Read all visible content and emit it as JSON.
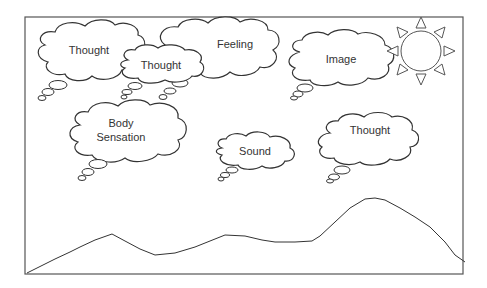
{
  "diagram": {
    "title": "",
    "clouds": [
      {
        "id": "thought-1",
        "label": "Thought"
      },
      {
        "id": "thought-2",
        "label": "Thought"
      },
      {
        "id": "feeling",
        "label": "Feeling"
      },
      {
        "id": "image",
        "label": "Image"
      },
      {
        "id": "body-sensation",
        "label_line1": "Body",
        "label_line2": "Sensation"
      },
      {
        "id": "sound",
        "label": "Sound"
      },
      {
        "id": "thought-3",
        "label": "Thought"
      }
    ],
    "elements": [
      "sun",
      "mountains",
      "frame"
    ],
    "colors": {
      "stroke": "#333333",
      "frame": "#555555",
      "background": "#ffffff"
    }
  }
}
